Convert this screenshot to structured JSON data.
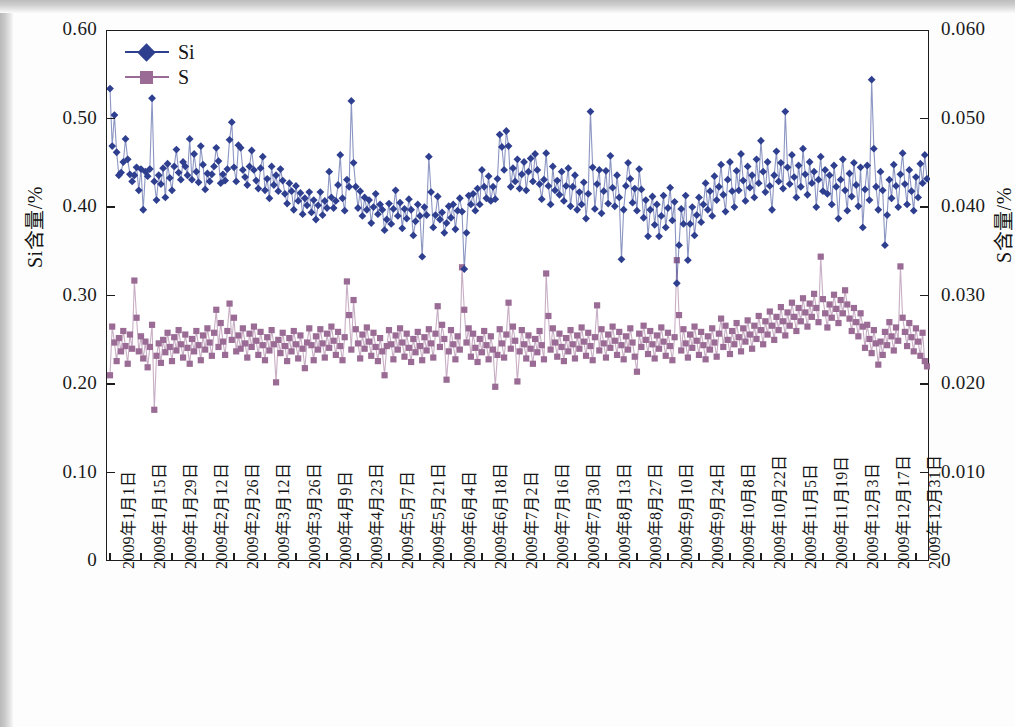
{
  "chart_data": {
    "type": "line",
    "title": "",
    "subtitle": "",
    "xlabel": "",
    "ylabel": "Si含量/%",
    "y2label": "S含量/%",
    "ylim": [
      0,
      0.6
    ],
    "y2lim": [
      0,
      0.06
    ],
    "y_ticks": [
      "0",
      "0.10",
      "0.20",
      "0.30",
      "0.40",
      "0.50",
      "0.60"
    ],
    "y_tick_values": [
      0,
      0.1,
      0.2,
      0.3,
      0.4,
      0.5,
      0.6
    ],
    "y2_ticks": [
      "0",
      "0.010",
      "0.020",
      "0.030",
      "0.040",
      "0.050",
      "0.060"
    ],
    "y2_tick_values": [
      0,
      0.01,
      0.02,
      0.03,
      0.04,
      0.05,
      0.06
    ],
    "grid": false,
    "legend_position": "top-left",
    "x_tick_interval_days": 14,
    "x_point_count": 365,
    "x_tick_labels": [
      "2009年1月1日",
      "2009年1月15日",
      "2009年1月29日",
      "2009年2月12日",
      "2009年2月26日",
      "2009年3月12日",
      "2009年3月26日",
      "2009年4月9日",
      "2009年4月23日",
      "2009年5月7日",
      "2009年5月21日",
      "2009年6月4日",
      "2009年6月18日",
      "2009年7月2日",
      "2009年7月16日",
      "2009年7月30日",
      "2009年8月13日",
      "2009年8月27日",
      "2009年9月10日",
      "2009年9月24日",
      "2009年10月8日",
      "2009年10月22日",
      "2009年11月5日",
      "2009年11月19日",
      "2009年12月3日",
      "2009年12月17日",
      "2009年12月31日"
    ],
    "series": [
      {
        "name": "Si",
        "axis": "left",
        "color": "#2e3f8f",
        "marker": "diamond",
        "unit": "%",
        "values": [
          0.535,
          0.47,
          0.505,
          0.463,
          0.437,
          0.44,
          0.452,
          0.478,
          0.455,
          0.438,
          0.43,
          0.437,
          0.446,
          0.42,
          0.444,
          0.398,
          0.441,
          0.436,
          0.444,
          0.524,
          0.43,
          0.409,
          0.437,
          0.427,
          0.445,
          0.412,
          0.45,
          0.434,
          0.42,
          0.447,
          0.466,
          0.44,
          0.432,
          0.452,
          0.447,
          0.437,
          0.478,
          0.432,
          0.461,
          0.441,
          0.429,
          0.47,
          0.449,
          0.421,
          0.439,
          0.43,
          0.438,
          0.447,
          0.468,
          0.453,
          0.428,
          0.438,
          0.431,
          0.444,
          0.477,
          0.497,
          0.446,
          0.43,
          0.471,
          0.468,
          0.443,
          0.435,
          0.426,
          0.447,
          0.465,
          0.443,
          0.431,
          0.422,
          0.445,
          0.458,
          0.42,
          0.433,
          0.411,
          0.447,
          0.426,
          0.437,
          0.419,
          0.444,
          0.431,
          0.416,
          0.405,
          0.428,
          0.419,
          0.398,
          0.425,
          0.408,
          0.417,
          0.393,
          0.411,
          0.403,
          0.418,
          0.395,
          0.409,
          0.387,
          0.403,
          0.418,
          0.392,
          0.408,
          0.4,
          0.441,
          0.412,
          0.4,
          0.408,
          0.426,
          0.46,
          0.411,
          0.397,
          0.432,
          0.424,
          0.521,
          0.451,
          0.424,
          0.4,
          0.419,
          0.391,
          0.412,
          0.398,
          0.409,
          0.383,
          0.401,
          0.416,
          0.393,
          0.404,
          0.398,
          0.375,
          0.387,
          0.405,
          0.382,
          0.399,
          0.42,
          0.391,
          0.406,
          0.377,
          0.399,
          0.388,
          0.41,
          0.398,
          0.369,
          0.385,
          0.404,
          0.391,
          0.345,
          0.401,
          0.392,
          0.458,
          0.418,
          0.378,
          0.392,
          0.413,
          0.387,
          0.395,
          0.372,
          0.383,
          0.402,
          0.389,
          0.404,
          0.376,
          0.397,
          0.411,
          0.396,
          0.331,
          0.372,
          0.414,
          0.404,
          0.416,
          0.397,
          0.422,
          0.404,
          0.443,
          0.424,
          0.411,
          0.436,
          0.408,
          0.424,
          0.41,
          0.433,
          0.483,
          0.469,
          0.443,
          0.487,
          0.47,
          0.424,
          0.445,
          0.43,
          0.455,
          0.422,
          0.438,
          0.452,
          0.42,
          0.441,
          0.456,
          0.43,
          0.461,
          0.443,
          0.427,
          0.41,
          0.432,
          0.462,
          0.425,
          0.404,
          0.447,
          0.42,
          0.431,
          0.415,
          0.441,
          0.408,
          0.425,
          0.445,
          0.402,
          0.424,
          0.437,
          0.398,
          0.418,
          0.404,
          0.429,
          0.388,
          0.416,
          0.509,
          0.446,
          0.399,
          0.427,
          0.443,
          0.394,
          0.419,
          0.442,
          0.405,
          0.459,
          0.423,
          0.402,
          0.437,
          0.412,
          0.342,
          0.398,
          0.425,
          0.451,
          0.433,
          0.406,
          0.422,
          0.397,
          0.444,
          0.421,
          0.389,
          0.409,
          0.368,
          0.398,
          0.413,
          0.381,
          0.404,
          0.368,
          0.391,
          0.414,
          0.378,
          0.4,
          0.423,
          0.386,
          0.407,
          0.315,
          0.358,
          0.399,
          0.382,
          0.414,
          0.341,
          0.382,
          0.401,
          0.369,
          0.392,
          0.412,
          0.384,
          0.404,
          0.428,
          0.398,
          0.419,
          0.391,
          0.436,
          0.409,
          0.424,
          0.449,
          0.415,
          0.396,
          0.432,
          0.452,
          0.419,
          0.401,
          0.442,
          0.42,
          0.461,
          0.431,
          0.408,
          0.447,
          0.423,
          0.437,
          0.412,
          0.455,
          0.428,
          0.476,
          0.441,
          0.418,
          0.452,
          0.425,
          0.398,
          0.437,
          0.464,
          0.43,
          0.451,
          0.422,
          0.509,
          0.446,
          0.427,
          0.46,
          0.435,
          0.412,
          0.448,
          0.424,
          0.467,
          0.438,
          0.415,
          0.452,
          0.428,
          0.441,
          0.401,
          0.432,
          0.458,
          0.419,
          0.443,
          0.416,
          0.437,
          0.404,
          0.448,
          0.424,
          0.388,
          0.432,
          0.455,
          0.42,
          0.397,
          0.439,
          0.413,
          0.451,
          0.426,
          0.402,
          0.446,
          0.378,
          0.421,
          0.448,
          0.409,
          0.545,
          0.467,
          0.424,
          0.398,
          0.441,
          0.42,
          0.358,
          0.392,
          0.432,
          0.411,
          0.449,
          0.425,
          0.401,
          0.438,
          0.462,
          0.427,
          0.404,
          0.443,
          0.419,
          0.397,
          0.435,
          0.412,
          0.45,
          0.428,
          0.46,
          0.433
        ]
      },
      {
        "name": "S",
        "axis": "right",
        "color": "#9a6b94",
        "marker": "square",
        "unit": "%",
        "values": [
          0.0211,
          0.0266,
          0.0248,
          0.0227,
          0.0253,
          0.0238,
          0.0261,
          0.0244,
          0.0224,
          0.0257,
          0.0241,
          0.0318,
          0.0276,
          0.0238,
          0.0255,
          0.023,
          0.0249,
          0.022,
          0.0243,
          0.0268,
          0.0172,
          0.0233,
          0.0247,
          0.0225,
          0.0251,
          0.0237,
          0.0259,
          0.0243,
          0.0227,
          0.0254,
          0.0239,
          0.0262,
          0.0246,
          0.0231,
          0.0257,
          0.0242,
          0.0224,
          0.0252,
          0.0238,
          0.0261,
          0.0245,
          0.0228,
          0.0256,
          0.024,
          0.0264,
          0.0248,
          0.0233,
          0.0259,
          0.0285,
          0.0243,
          0.027,
          0.0249,
          0.0234,
          0.0261,
          0.0292,
          0.0251,
          0.0276,
          0.0238,
          0.0256,
          0.0241,
          0.0264,
          0.0247,
          0.0231,
          0.0258,
          0.0243,
          0.0266,
          0.025,
          0.0234,
          0.026,
          0.0245,
          0.0228,
          0.0254,
          0.0239,
          0.0262,
          0.0246,
          0.0203,
          0.0251,
          0.0236,
          0.0259,
          0.0244,
          0.0227,
          0.0253,
          0.0238,
          0.0261,
          0.0246,
          0.023,
          0.0256,
          0.0241,
          0.0219,
          0.0248,
          0.0264,
          0.0245,
          0.0228,
          0.0255,
          0.024,
          0.0263,
          0.0247,
          0.0231,
          0.0258,
          0.0242,
          0.0266,
          0.025,
          0.0234,
          0.026,
          0.0244,
          0.0228,
          0.0254,
          0.0317,
          0.0279,
          0.024,
          0.0296,
          0.0263,
          0.0247,
          0.023,
          0.0257,
          0.0241,
          0.0265,
          0.0249,
          0.0233,
          0.0259,
          0.0243,
          0.0227,
          0.0253,
          0.0238,
          0.0211,
          0.0244,
          0.0262,
          0.0246,
          0.0229,
          0.0256,
          0.024,
          0.0264,
          0.0248,
          0.0232,
          0.0258,
          0.0242,
          0.0226,
          0.0252,
          0.0237,
          0.026,
          0.0244,
          0.0228,
          0.0254,
          0.0239,
          0.0263,
          0.0247,
          0.0231,
          0.0258,
          0.0289,
          0.0243,
          0.0268,
          0.0252,
          0.0206,
          0.0238,
          0.0262,
          0.0246,
          0.0229,
          0.0255,
          0.024,
          0.0333,
          0.0285,
          0.0248,
          0.0264,
          0.0232,
          0.0258,
          0.0242,
          0.0226,
          0.0252,
          0.0237,
          0.0261,
          0.0245,
          0.0229,
          0.0255,
          0.024,
          0.0198,
          0.0234,
          0.0263,
          0.0247,
          0.0231,
          0.0257,
          0.0293,
          0.0241,
          0.0266,
          0.025,
          0.0204,
          0.0238,
          0.0262,
          0.0246,
          0.023,
          0.0256,
          0.0241,
          0.0224,
          0.0252,
          0.0237,
          0.0261,
          0.0245,
          0.0229,
          0.0326,
          0.0278,
          0.024,
          0.0264,
          0.0248,
          0.0232,
          0.0258,
          0.0243,
          0.0227,
          0.0253,
          0.0238,
          0.0262,
          0.0246,
          0.023,
          0.0256,
          0.0241,
          0.0265,
          0.0249,
          0.0233,
          0.0259,
          0.0244,
          0.0228,
          0.0254,
          0.029,
          0.0239,
          0.0263,
          0.0247,
          0.0231,
          0.0257,
          0.0242,
          0.0266,
          0.025,
          0.0234,
          0.026,
          0.0245,
          0.0229,
          0.0255,
          0.024,
          0.0264,
          0.0248,
          0.0232,
          0.0215,
          0.0258,
          0.0243,
          0.0267,
          0.0251,
          0.0235,
          0.0261,
          0.0246,
          0.023,
          0.0256,
          0.0241,
          0.0265,
          0.0249,
          0.0233,
          0.0259,
          0.0244,
          0.0228,
          0.0254,
          0.0341,
          0.0279,
          0.0239,
          0.0263,
          0.0247,
          0.0231,
          0.0257,
          0.0242,
          0.0266,
          0.025,
          0.0234,
          0.026,
          0.0245,
          0.0229,
          0.0255,
          0.024,
          0.0264,
          0.0248,
          0.0232,
          0.0258,
          0.0275,
          0.0243,
          0.0267,
          0.0251,
          0.0235,
          0.0261,
          0.0246,
          0.027,
          0.0254,
          0.0238,
          0.0264,
          0.0249,
          0.0273,
          0.0257,
          0.0241,
          0.0267,
          0.0252,
          0.0278,
          0.0262,
          0.0246,
          0.0272,
          0.0257,
          0.0283,
          0.0267,
          0.0251,
          0.0277,
          0.0262,
          0.0288,
          0.0272,
          0.0256,
          0.0282,
          0.0267,
          0.0293,
          0.0277,
          0.0261,
          0.0287,
          0.0272,
          0.0298,
          0.0282,
          0.0266,
          0.0292,
          0.0277,
          0.0303,
          0.0287,
          0.0271,
          0.0345,
          0.0297,
          0.0281,
          0.0265,
          0.0291,
          0.0276,
          0.0302,
          0.0286,
          0.027,
          0.0296,
          0.0281,
          0.0307,
          0.0291,
          0.0275,
          0.0261,
          0.0287,
          0.0271,
          0.0255,
          0.0281,
          0.0266,
          0.0242,
          0.0268,
          0.0252,
          0.0236,
          0.0262,
          0.0247,
          0.0223,
          0.0249,
          0.0234,
          0.026,
          0.0245,
          0.0271,
          0.0255,
          0.0239,
          0.0265,
          0.025,
          0.0334,
          0.0276,
          0.026,
          0.0244,
          0.027,
          0.0254,
          0.0238,
          0.0264,
          0.0249,
          0.0233,
          0.0259,
          0.0227,
          0.0221
        ]
      }
    ]
  },
  "legend": {
    "entries": [
      {
        "label": "Si",
        "color": "#2e3f8f",
        "marker": "diamond"
      },
      {
        "label": "S",
        "color": "#9a6b94",
        "marker": "square"
      }
    ]
  },
  "axes": {
    "left_title": "Si含量/%",
    "right_title": "S含量/%"
  },
  "colors": {
    "si": "#2e3f8f",
    "s": "#9a6b94",
    "axis": "#1d1d1d",
    "text": "#151515",
    "page": "#fdfdfd"
  }
}
